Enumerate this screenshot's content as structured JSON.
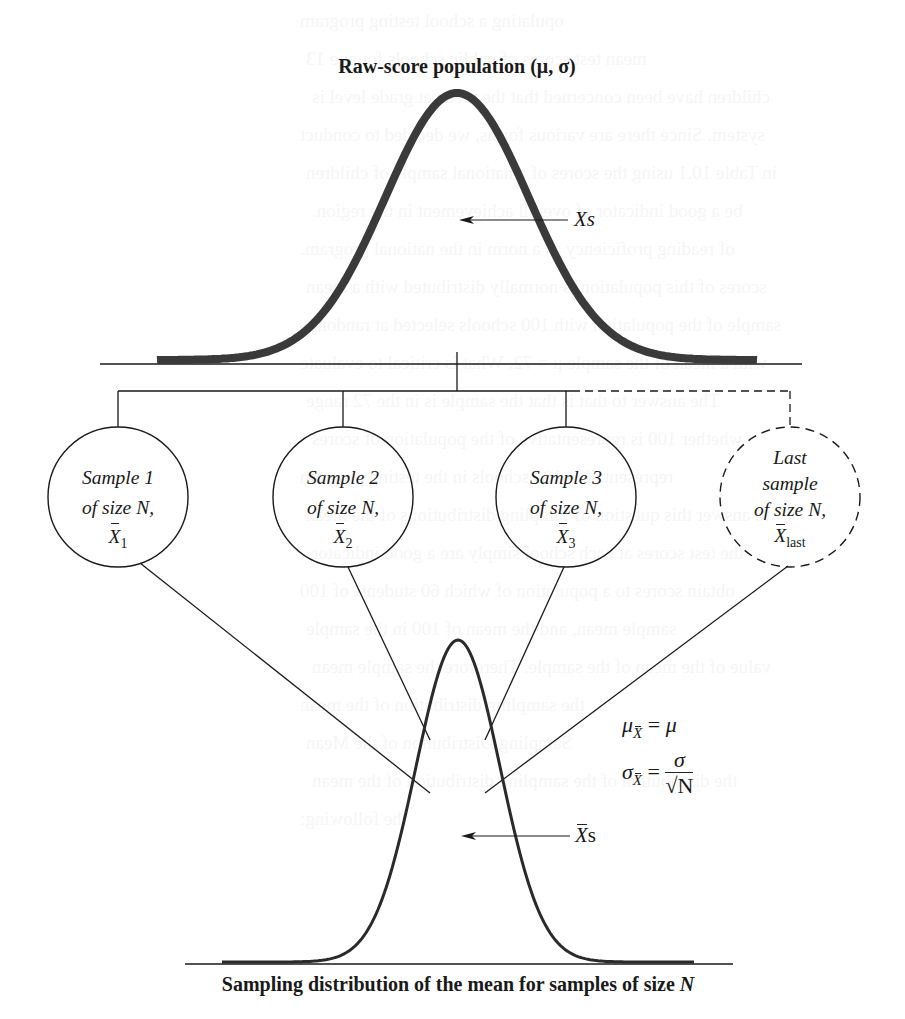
{
  "diagram": {
    "title": "Raw-score population (μ, σ)",
    "top_arrow_label": "Xs",
    "samples": [
      {
        "line1": "Sample 1",
        "line2": "of size N,",
        "mean_symbol": "X",
        "mean_sub": "1"
      },
      {
        "line1": "Sample 2",
        "line2": "of size N,",
        "mean_symbol": "X",
        "mean_sub": "2"
      },
      {
        "line1": "Sample 3",
        "line2": "of size N,",
        "mean_symbol": "X",
        "mean_sub": "3"
      },
      {
        "line0": "Last",
        "line1": "sample",
        "line2": "of size N,",
        "mean_symbol": "X",
        "mean_sub": "last"
      }
    ],
    "formulas": {
      "mean": {
        "lhs": "μ",
        "sub": "X",
        "eq": "=",
        "rhs": "μ"
      },
      "sd": {
        "lhs": "σ",
        "sub": "X",
        "eq": "=",
        "num": "σ",
        "den": "√N"
      }
    },
    "bottom_arrow_label": "X",
    "bottom_arrow_suffix": "s",
    "caption_main": "Sampling distribution of the mean for samples of size ",
    "caption_var": "N"
  },
  "colors": {
    "ink": "#1a1a1a",
    "curve_top": "#3a3a3a",
    "background": "#ffffff"
  },
  "ghost_text": [
    "opulating a school testing program",
    "mean test scores of public schools for age 13",
    "children have been concerned that the mean at grade level is",
    "system. Since there are various forms, we decided to conduct",
    "in Table 10.1 using the scores of a national sample of children",
    "be a good indicator of overall achievement in the region.",
    "of reading proficiency as a norm in the national program.",
    "scores of this population is normally distributed with a mean",
    "sample of the population with 100 schools selected at random",
    "with a mean of the sample μ = 72. What is critical to evaluate",
    "The answer to that is that the sample is in the 72 range",
    "whether 100 is representative of the population of scores",
    "representative 100 schools in the testing program",
    "to answer this question of sampling distributions of the mean",
    "the test scores at each school simply are a good indicator",
    "obtain scores to a population of which 60 students of 100",
    "sample mean, and the mean of 100 in the sample",
    "value of the mean of the sample. Therefore the sample mean",
    "the sampling distribution of the mean",
    "Sampling Distribution of the Mean",
    "the distribution of the sampling distribution of the mean",
    "the following:"
  ]
}
